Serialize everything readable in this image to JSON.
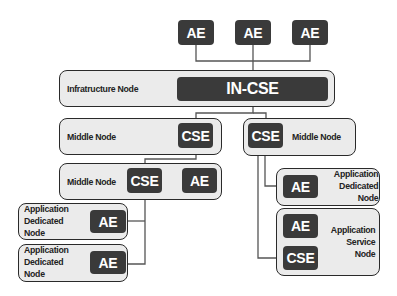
{
  "diagram": {
    "top_aes": [
      {
        "label": "AE"
      },
      {
        "label": "AE"
      },
      {
        "label": "AE"
      }
    ],
    "infrastructure_node": {
      "label": "Infratructure Node",
      "cse": "IN-CSE"
    },
    "middle_node_left": {
      "label": "Middle Node",
      "cse": "CSE"
    },
    "middle_node_right": {
      "label": "Middle Node",
      "cse": "CSE"
    },
    "middle_node_lower": {
      "label": "Middle Node",
      "cse": "CSE",
      "ae": "AE"
    },
    "adn_left_1": {
      "label_lines": [
        "Application",
        "Dedicated",
        "Node"
      ],
      "ae": "AE"
    },
    "adn_left_2": {
      "label_lines": [
        "Application",
        "Dedicated",
        "Node"
      ],
      "ae": "AE"
    },
    "adn_right": {
      "label_lines": [
        "Application",
        "Dedicated",
        "Node"
      ],
      "ae": "AE"
    },
    "asn_right": {
      "label_lines": [
        "Application",
        "Service",
        "Node"
      ],
      "ae": "AE",
      "cse": "CSE"
    },
    "colors": {
      "node_fill": "#ebebeb",
      "entity_fill": "#3a3a3a",
      "line": "#555555"
    }
  }
}
